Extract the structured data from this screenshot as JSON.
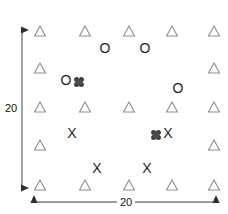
{
  "figure": {
    "width": 228,
    "height": 214,
    "background": "#ffffff"
  },
  "axes": {
    "vertical": {
      "name": "vertical-extent-arrow",
      "label": "20",
      "x": 22,
      "y_start": 28,
      "y_end": 190,
      "color": "#3a3a3a",
      "double_headed": true
    },
    "horizontal": {
      "name": "horizontal-extent-arrow",
      "label": "20",
      "y": 202,
      "x_start": 32,
      "x_end": 218,
      "color": "#3a3a3a",
      "double_headed": true
    }
  },
  "chart_data": {
    "type": "scatter",
    "title": "",
    "xlabel": "20",
    "ylabel": "20",
    "xlim": [
      0,
      20
    ],
    "ylim": [
      0,
      20
    ],
    "grid": false,
    "legend": "none",
    "marker_colors": {
      "triangle": "#8f8f8f",
      "circle": "#1f1f1f",
      "cross": "#1f1f1f",
      "cluster": "#434343"
    },
    "series": [
      {
        "name": "triangle",
        "glyph": "triangle-outline",
        "count": 16,
        "points": [
          {
            "px": 40,
            "py": 31
          },
          {
            "px": 85,
            "py": 31
          },
          {
            "px": 129,
            "py": 31
          },
          {
            "px": 172,
            "py": 31
          },
          {
            "px": 214,
            "py": 31
          },
          {
            "px": 40,
            "py": 68
          },
          {
            "px": 214,
            "py": 68
          },
          {
            "px": 40,
            "py": 107
          },
          {
            "px": 85,
            "py": 107
          },
          {
            "px": 129,
            "py": 107
          },
          {
            "px": 172,
            "py": 107
          },
          {
            "px": 214,
            "py": 107
          },
          {
            "px": 40,
            "py": 145
          },
          {
            "px": 214,
            "py": 145
          },
          {
            "px": 40,
            "py": 185
          },
          {
            "px": 85,
            "py": 185
          },
          {
            "px": 129,
            "py": 185
          },
          {
            "px": 172,
            "py": 185
          },
          {
            "px": 214,
            "py": 185
          }
        ]
      },
      {
        "name": "circle",
        "glyph": "O",
        "count": 4,
        "points": [
          {
            "px": 105,
            "py": 48
          },
          {
            "px": 145,
            "py": 48
          },
          {
            "px": 66,
            "py": 80
          },
          {
            "px": 178,
            "py": 88
          }
        ]
      },
      {
        "name": "cross",
        "glyph": "X",
        "count": 4,
        "points": [
          {
            "px": 72,
            "py": 133
          },
          {
            "px": 168,
            "py": 133
          },
          {
            "px": 97,
            "py": 168
          },
          {
            "px": 147,
            "py": 168
          }
        ]
      },
      {
        "name": "cluster",
        "glyph": "dark-rosette",
        "count": 2,
        "points": [
          {
            "px": 79,
            "py": 82
          },
          {
            "px": 156,
            "py": 135
          }
        ]
      }
    ]
  }
}
